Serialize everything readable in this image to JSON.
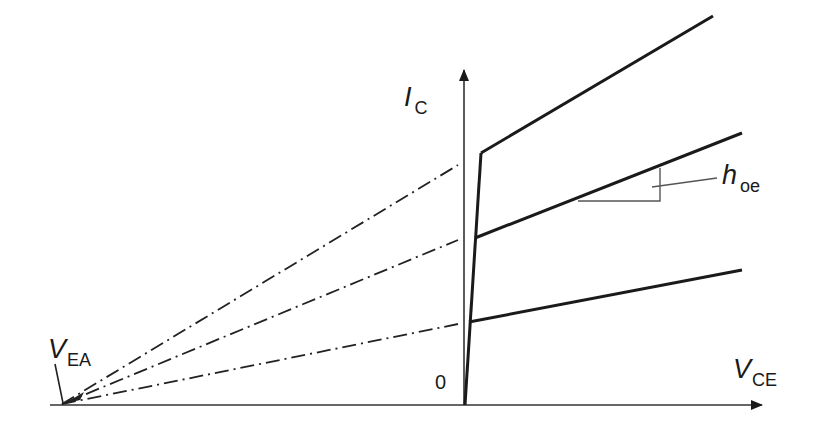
{
  "diagram": {
    "title": "",
    "type": "BJT output characteristics with Early voltage",
    "axes": {
      "x": {
        "symbol": "V",
        "subscript": "CE"
      },
      "y": {
        "symbol": "I",
        "subscript": "C"
      },
      "origin_label": "0"
    },
    "early_voltage": {
      "symbol": "V",
      "subscript": "EA"
    },
    "slope_label": {
      "symbol": "h",
      "subscript": "oe"
    },
    "curves": [
      {
        "name": "curve-high-ib",
        "knee": [
          481,
          153
        ],
        "end": [
          713,
          16
        ],
        "extrapolated": true
      },
      {
        "name": "curve-mid-ib",
        "knee": [
          475,
          238
        ],
        "end": [
          742,
          133
        ],
        "extrapolated": true
      },
      {
        "name": "curve-low-ib",
        "knee": [
          469,
          322
        ],
        "end": [
          742,
          270
        ],
        "extrapolated": true
      }
    ],
    "colors": {
      "line": "#1a1a1a",
      "thin": "#555555",
      "background": "#ffffff"
    }
  }
}
